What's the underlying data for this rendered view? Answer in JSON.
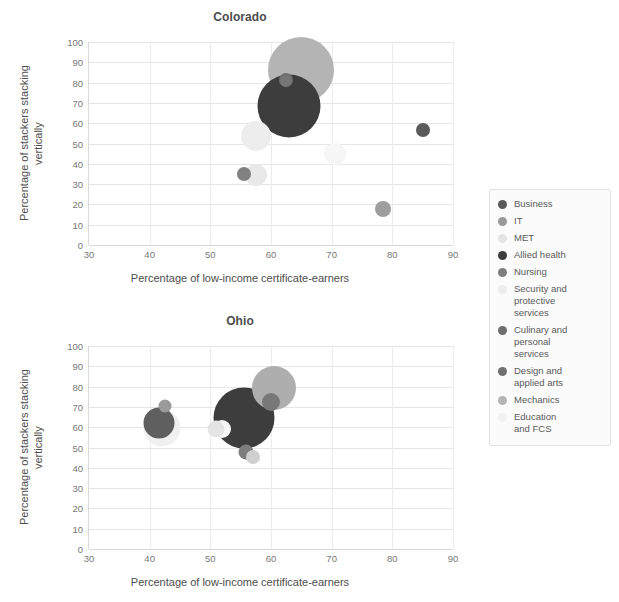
{
  "figure": {
    "x_axis_label": "Percentage of low-income certificate-earners",
    "y_axis_label": "Percentage of stackers stacking\nvertically",
    "xticks": [
      "30",
      "40",
      "50",
      "60",
      "70",
      "80",
      "90"
    ],
    "yticks": [
      "0",
      "10",
      "20",
      "30",
      "40",
      "50",
      "60",
      "70",
      "80",
      "90",
      "100"
    ]
  },
  "legend": {
    "items": [
      {
        "label": "Business",
        "color": "#5a5a5a"
      },
      {
        "label": "IT",
        "color": "#9a9a9a"
      },
      {
        "label": "MET",
        "color": "#e4e4e4"
      },
      {
        "label": "Allied health",
        "color": "#3d3d3d"
      },
      {
        "label": "Nursing",
        "color": "#7d7d7d"
      },
      {
        "label": "Security and\nprotective\nservices",
        "color": "#ededed"
      },
      {
        "label": "Culinary and\npersonal\nservices",
        "color": "#6e6e6e"
      },
      {
        "label": "Design and\napplied arts",
        "color": "#707070"
      },
      {
        "label": "Mechanics",
        "color": "#b4b4b4"
      },
      {
        "label": "Education\nand FCS",
        "color": "#f2f2f2"
      }
    ]
  },
  "chart_data": [
    {
      "type": "scatter",
      "title": "Colorado",
      "xlabel": "Percentage of low-income certificate-earners",
      "ylabel": "Percentage of stackers stacking vertically",
      "xlim": [
        30,
        90
      ],
      "ylim": [
        0,
        100
      ],
      "grid": true,
      "legend_position": "right",
      "points": [
        {
          "name": "Business",
          "x": 85.0,
          "y": 56.5,
          "size": 14,
          "color": "#5a5a5a"
        },
        {
          "name": "IT",
          "x": 78.5,
          "y": 17.5,
          "size": 16,
          "color": "#9e9e9e"
        },
        {
          "name": "MET",
          "x": 57.5,
          "y": 34.5,
          "size": 22,
          "color": "#e8e8e8"
        },
        {
          "name": "Allied health",
          "x": 63.0,
          "y": 68.5,
          "size": 63,
          "color": "#3d3d3d"
        },
        {
          "name": "Nursing",
          "x": 55.5,
          "y": 35.0,
          "size": 14,
          "color": "#808080"
        },
        {
          "name": "Security and protective services",
          "x": 57.5,
          "y": 53.5,
          "size": 30,
          "color": "#ededed"
        },
        {
          "name": "Culinary and personal services",
          "x": 62.5,
          "y": 81.5,
          "size": 14,
          "color": "#6e6e6e"
        },
        {
          "name": "Design and applied arts",
          "x": 62.5,
          "y": 81.0,
          "size": 11,
          "color": "#767676"
        },
        {
          "name": "Mechanics",
          "x": 65.0,
          "y": 86.0,
          "size": 66,
          "color": "#b4b4b4"
        },
        {
          "name": "Education and FCS",
          "x": 70.5,
          "y": 45.0,
          "size": 22,
          "color": "#f6f6f6"
        }
      ]
    },
    {
      "type": "scatter",
      "title": "Ohio",
      "xlabel": "Percentage of low-income certificate-earners",
      "ylabel": "Percentage of stackers stacking vertically",
      "xlim": [
        30,
        90
      ],
      "ylim": [
        0,
        100
      ],
      "grid": true,
      "legend_position": "right",
      "points": [
        {
          "name": "Business",
          "x": 41.5,
          "y": 62.0,
          "size": 31,
          "color": "#5f5f5f"
        },
        {
          "name": "IT",
          "x": 42.5,
          "y": 70.5,
          "size": 13,
          "color": "#9a9a9a"
        },
        {
          "name": "MET",
          "x": 51.0,
          "y": 59.0,
          "size": 17,
          "color": "#e4e4e4"
        },
        {
          "name": "Allied health",
          "x": 55.5,
          "y": 64.5,
          "size": 61,
          "color": "#3d3d3d"
        },
        {
          "name": "Nursing",
          "x": 55.8,
          "y": 48.0,
          "size": 15,
          "color": "#7d7d7d"
        },
        {
          "name": "Security and protective services",
          "x": 42.0,
          "y": 59.5,
          "size": 37,
          "color": "#f0f0f0"
        },
        {
          "name": "Culinary and personal services",
          "x": 57.0,
          "y": 45.5,
          "size": 14,
          "color": "#cfcfcf"
        },
        {
          "name": "Design and applied arts",
          "x": 60.0,
          "y": 72.5,
          "size": 18,
          "color": "#787878"
        },
        {
          "name": "Mechanics",
          "x": 60.5,
          "y": 79.5,
          "size": 44,
          "color": "#aeaeae"
        },
        {
          "name": "Education and FCS",
          "x": 52.0,
          "y": 59.0,
          "size": 18,
          "color": "#f6f6f6"
        }
      ]
    }
  ]
}
